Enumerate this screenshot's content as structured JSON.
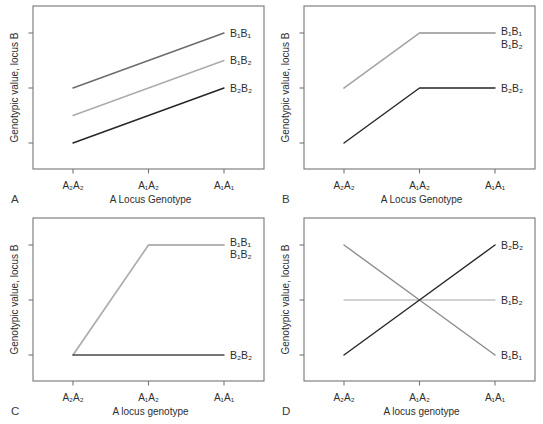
{
  "figure": {
    "background": "#ffffff",
    "text_color": "#2e2e2e",
    "axis_color": "#767676",
    "panel_letter_color": "#3a3a3a"
  },
  "chart_data": [
    {
      "type": "line",
      "panel_letter": "A",
      "title": "",
      "xlabel": "A Locus Genotype",
      "ylabel": "Genotypic value, locus B",
      "x_categories": [
        "A₂A₂",
        "A₁A₂",
        "A₁A₁"
      ],
      "y_axis": {
        "tick_count": 3,
        "tick_labels_shown": false,
        "unit_range": [
          1,
          3
        ]
      },
      "grid": false,
      "legend_position": "labels at right ends of lines",
      "series": [
        {
          "name": "B₁B₁",
          "color": "#6b6b6b",
          "values": [
            2,
            2.5,
            3
          ],
          "label_v": 3
        },
        {
          "name": "B₁B₂",
          "color": "#ababab",
          "values": [
            1.5,
            2,
            2.5
          ],
          "label_v": 2.5
        },
        {
          "name": "B₂B₂",
          "color": "#262626",
          "values": [
            1,
            1.5,
            2
          ],
          "label_v": 2
        }
      ]
    },
    {
      "type": "line",
      "panel_letter": "B",
      "title": "",
      "xlabel": "A Locus Genotype",
      "ylabel": "Genotypic value, locus B",
      "x_categories": [
        "A₂A₂",
        "A₁A₂",
        "A₁A₁"
      ],
      "y_axis": {
        "tick_count": 3,
        "tick_labels_shown": false,
        "unit_range": [
          1,
          3
        ]
      },
      "grid": false,
      "legend_position": "labels at right ends of lines",
      "series": [
        {
          "name": "B₁B₁",
          "color": "#a8a8a8",
          "values": [
            2,
            3,
            3
          ],
          "label_v": 3.02
        },
        {
          "name": "B₁B₂",
          "color": "#a8a8a8",
          "values": [
            2,
            3,
            3
          ],
          "label_v": 2.8
        },
        {
          "name": "B₂B₂",
          "color": "#262626",
          "values": [
            1,
            2,
            2
          ],
          "label_v": 2
        }
      ]
    },
    {
      "type": "line",
      "panel_letter": "C",
      "title": "",
      "xlabel": "A locus genotype",
      "ylabel": "Genotypic value, locus B",
      "x_categories": [
        "A₂A₂",
        "A₁A₂",
        "A₁A₁"
      ],
      "y_axis": {
        "tick_count": 3,
        "tick_labels_shown": false,
        "unit_range": [
          1,
          3
        ]
      },
      "grid": false,
      "legend_position": "labels at right ends of lines",
      "series": [
        {
          "name": "B₁B₁",
          "color": "#b0b0b0",
          "values": [
            1,
            3,
            3
          ],
          "label_v": 3.05
        },
        {
          "name": "B₁B₂",
          "color": "#b0b0b0",
          "values": [
            1,
            3,
            3
          ],
          "label_v": 2.83
        },
        {
          "name": "B₂B₂",
          "color": "#4a4a4a",
          "values": [
            1,
            1,
            1
          ],
          "label_v": 1
        }
      ]
    },
    {
      "type": "line",
      "panel_letter": "D",
      "title": "",
      "xlabel": "A locus genotype",
      "ylabel": "Genotypic value, locus B",
      "x_categories": [
        "A₂A₂",
        "A₁A₂",
        "A₁A₁"
      ],
      "y_axis": {
        "tick_count": 3,
        "tick_labels_shown": false,
        "unit_range": [
          1,
          3
        ]
      },
      "grid": false,
      "legend_position": "labels at right ends of lines",
      "series": [
        {
          "name": "B₂B₂",
          "color": "#262626",
          "values": [
            1,
            2,
            3
          ],
          "label_v": 3
        },
        {
          "name": "B₁B₂",
          "color": "#c2c2c2",
          "values": [
            2,
            2,
            2
          ],
          "label_v": 2
        },
        {
          "name": "B₁B₁",
          "color": "#8c8c8c",
          "values": [
            3,
            2,
            1
          ],
          "label_v": 1
        }
      ]
    }
  ]
}
